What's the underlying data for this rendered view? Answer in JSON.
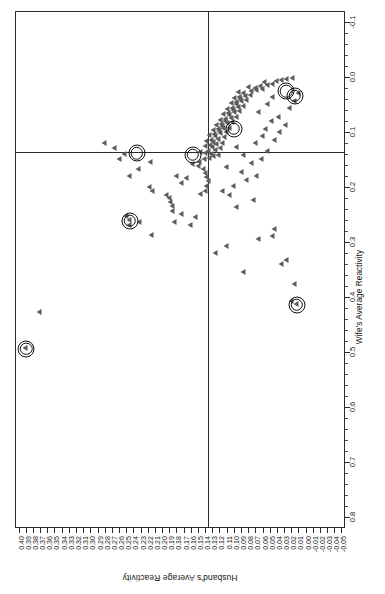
{
  "chart_data": {
    "type": "scatter",
    "title": "",
    "xlabel": "Wife's Average Reactivity",
    "ylabel": "Husband's Average Reactivity",
    "orientation": "rotated-90-landscape",
    "grid": false,
    "legend": null,
    "xlim": [
      -0.12,
      0.82
    ],
    "ylim": [
      -0.055,
      0.405
    ],
    "x_ticks": [
      -0.1,
      0.0,
      0.1,
      0.2,
      0.3,
      0.4,
      0.5,
      0.6,
      0.7,
      0.8
    ],
    "x_tick_labels": [
      "-0.1",
      "0.0",
      "0.1",
      "0.2",
      "0.3",
      "0.4",
      "0.5",
      "0.6",
      "0.7",
      "0.8"
    ],
    "y_ticks": [
      0.4,
      0.39,
      0.38,
      0.37,
      0.36,
      0.35,
      0.34,
      0.33,
      0.32,
      0.31,
      0.3,
      0.29,
      0.28,
      0.27,
      0.26,
      0.25,
      0.24,
      0.23,
      0.22,
      0.21,
      0.2,
      0.19,
      0.18,
      0.17,
      0.16,
      0.15,
      0.14,
      0.13,
      0.12,
      0.11,
      0.1,
      0.09,
      0.08,
      0.07,
      0.06,
      0.05,
      0.04,
      0.03,
      0.02,
      0.01,
      0.0,
      -0.01,
      -0.02,
      -0.03,
      -0.04,
      -0.05
    ],
    "y_tick_labels": [
      "0.40",
      "0.39",
      "0.38",
      "0.37",
      "0.36",
      "0.35",
      "0.34",
      "0.33",
      "0.32",
      "0.31",
      "0.30",
      "0.29",
      "0.28",
      "0.27",
      "0.26",
      "0.25",
      "0.24",
      "0.23",
      "0.22",
      "0.21",
      "0.20",
      "0.19",
      "0.18",
      "0.17",
      "0.16",
      "0.15",
      "0.14",
      "0.13",
      "0.12",
      "0.11",
      "0.10",
      "0.09",
      "0.08",
      "0.07",
      "0.06",
      "0.05",
      "0.04",
      "0.03",
      "0.02",
      "0.01",
      "0.00",
      "-0.01",
      "-0.02",
      "-0.03",
      "-0.04",
      "-0.05"
    ],
    "reference_lines": {
      "vline_x": 0.135,
      "hline_y": 0.138
    },
    "marker": "triangle-left",
    "marker_color": "#5d5d5d",
    "highlight_color": "#111111",
    "points": [
      [
        0.425,
        0.373
      ],
      [
        0.49,
        0.392
      ],
      [
        0.41,
        0.015
      ],
      [
        0.405,
        0.022
      ],
      [
        0.375,
        0.018
      ],
      [
        0.338,
        0.035
      ],
      [
        0.33,
        0.028
      ],
      [
        0.352,
        0.088
      ],
      [
        0.288,
        0.048
      ],
      [
        0.275,
        0.045
      ],
      [
        0.262,
        0.233
      ],
      [
        0.258,
        0.248
      ],
      [
        0.25,
        0.252
      ],
      [
        0.268,
        0.247
      ],
      [
        0.285,
        0.217
      ],
      [
        0.262,
        0.185
      ],
      [
        0.248,
        0.175
      ],
      [
        0.242,
        0.188
      ],
      [
        0.232,
        0.188
      ],
      [
        0.225,
        0.19
      ],
      [
        0.218,
        0.192
      ],
      [
        0.212,
        0.196
      ],
      [
        0.205,
        0.215
      ],
      [
        0.198,
        0.22
      ],
      [
        0.19,
        0.175
      ],
      [
        0.182,
        0.168
      ],
      [
        0.178,
        0.182
      ],
      [
        0.21,
        0.148
      ],
      [
        0.205,
        0.142
      ],
      [
        0.196,
        0.14
      ],
      [
        0.188,
        0.138
      ],
      [
        0.18,
        0.14
      ],
      [
        0.172,
        0.142
      ],
      [
        0.165,
        0.145
      ],
      [
        0.16,
        0.152
      ],
      [
        0.156,
        0.16
      ],
      [
        0.152,
        0.15
      ],
      [
        0.148,
        0.143
      ],
      [
        0.145,
        0.136
      ],
      [
        0.142,
        0.13
      ],
      [
        0.14,
        0.124
      ],
      [
        0.138,
        0.133
      ],
      [
        0.136,
        0.141
      ],
      [
        0.134,
        0.148
      ],
      [
        0.132,
        0.138
      ],
      [
        0.13,
        0.128
      ],
      [
        0.128,
        0.12
      ],
      [
        0.126,
        0.132
      ],
      [
        0.124,
        0.142
      ],
      [
        0.122,
        0.135
      ],
      [
        0.12,
        0.126
      ],
      [
        0.118,
        0.118
      ],
      [
        0.116,
        0.13
      ],
      [
        0.114,
        0.14
      ],
      [
        0.112,
        0.133
      ],
      [
        0.11,
        0.124
      ],
      [
        0.108,
        0.115
      ],
      [
        0.106,
        0.127
      ],
      [
        0.104,
        0.136
      ],
      [
        0.102,
        0.129
      ],
      [
        0.1,
        0.12
      ],
      [
        0.098,
        0.112
      ],
      [
        0.097,
        0.122
      ],
      [
        0.095,
        0.131
      ],
      [
        0.093,
        0.124
      ],
      [
        0.091,
        0.116
      ],
      [
        0.09,
        0.108
      ],
      [
        0.088,
        0.118
      ],
      [
        0.086,
        0.126
      ],
      [
        0.084,
        0.119
      ],
      [
        0.082,
        0.111
      ],
      [
        0.08,
        0.104
      ],
      [
        0.078,
        0.113
      ],
      [
        0.076,
        0.121
      ],
      [
        0.074,
        0.114
      ],
      [
        0.072,
        0.106
      ],
      [
        0.07,
        0.099
      ],
      [
        0.068,
        0.108
      ],
      [
        0.066,
        0.116
      ],
      [
        0.064,
        0.109
      ],
      [
        0.062,
        0.101
      ],
      [
        0.06,
        0.094
      ],
      [
        0.058,
        0.103
      ],
      [
        0.056,
        0.111
      ],
      [
        0.054,
        0.104
      ],
      [
        0.052,
        0.096
      ],
      [
        0.05,
        0.089
      ],
      [
        0.048,
        0.098
      ],
      [
        0.046,
        0.106
      ],
      [
        0.044,
        0.099
      ],
      [
        0.042,
        0.091
      ],
      [
        0.04,
        0.084
      ],
      [
        0.038,
        0.093
      ],
      [
        0.036,
        0.101
      ],
      [
        0.034,
        0.094
      ],
      [
        0.032,
        0.086
      ],
      [
        0.03,
        0.079
      ],
      [
        0.028,
        0.088
      ],
      [
        0.026,
        0.096
      ],
      [
        0.024,
        0.078
      ],
      [
        0.022,
        0.07
      ],
      [
        0.02,
        0.062
      ],
      [
        0.018,
        0.072
      ],
      [
        0.016,
        0.082
      ],
      [
        0.014,
        0.065
      ],
      [
        0.012,
        0.055
      ],
      [
        0.01,
        0.048
      ],
      [
        0.008,
        0.06
      ],
      [
        0.006,
        0.042
      ],
      [
        0.004,
        0.035
      ],
      [
        0.002,
        0.028
      ],
      [
        0.0,
        0.02
      ],
      [
        0.235,
        0.098
      ],
      [
        0.222,
        0.075
      ],
      [
        0.213,
        0.108
      ],
      [
        0.205,
        0.118
      ],
      [
        0.196,
        0.102
      ],
      [
        0.186,
        0.085
      ],
      [
        0.178,
        0.07
      ],
      [
        0.17,
        0.092
      ],
      [
        0.162,
        0.112
      ],
      [
        0.155,
        0.078
      ],
      [
        0.148,
        0.063
      ],
      [
        0.14,
        0.088
      ],
      [
        0.132,
        0.055
      ],
      [
        0.125,
        0.098
      ],
      [
        0.118,
        0.072
      ],
      [
        0.112,
        0.045
      ],
      [
        0.105,
        0.062
      ],
      [
        0.098,
        0.038
      ],
      [
        0.092,
        0.058
      ],
      [
        0.085,
        0.03
      ],
      [
        0.078,
        0.05
      ],
      [
        0.07,
        0.04
      ],
      [
        0.062,
        0.068
      ],
      [
        0.055,
        0.025
      ],
      [
        0.048,
        0.055
      ],
      [
        0.042,
        0.018
      ],
      [
        0.035,
        0.048
      ],
      [
        0.028,
        0.012
      ],
      [
        0.305,
        0.112
      ],
      [
        0.292,
        0.068
      ],
      [
        0.318,
        0.128
      ],
      [
        0.152,
        0.218
      ],
      [
        0.165,
        0.235
      ],
      [
        0.178,
        0.248
      ],
      [
        0.148,
        0.262
      ],
      [
        0.138,
        0.255
      ],
      [
        0.128,
        0.268
      ],
      [
        0.118,
        0.282
      ],
      [
        0.252,
        0.155
      ],
      [
        0.268,
        0.162
      ]
    ],
    "highlighted_points": [
      [
        0.49,
        0.392
      ],
      [
        0.41,
        0.015
      ],
      [
        0.258,
        0.248
      ],
      [
        0.135,
        0.238
      ],
      [
        0.138,
        0.16
      ],
      [
        0.09,
        0.103
      ],
      [
        0.022,
        0.03
      ],
      [
        0.03,
        0.018
      ]
    ],
    "n_points": 152,
    "n_highlighted": 8
  },
  "axes": {
    "x": {
      "title": "Wife's Average Reactivity",
      "labels": [
        "-0.1",
        "0.0",
        "0.1",
        "0.2",
        "0.3",
        "0.4",
        "0.5",
        "0.6",
        "0.7",
        "0.8"
      ]
    },
    "y": {
      "title": "Husband's Average Reactivity",
      "labels": [
        "0.40",
        "0.39",
        "0.38",
        "0.37",
        "0.36",
        "0.35",
        "0.34",
        "0.33",
        "0.32",
        "0.31",
        "0.30",
        "0.29",
        "0.28",
        "0.27",
        "0.26",
        "0.25",
        "0.24",
        "0.23",
        "0.22",
        "0.21",
        "0.20",
        "0.19",
        "0.18",
        "0.17",
        "0.16",
        "0.15",
        "0.14",
        "0.13",
        "0.12",
        "0.11",
        "0.10",
        "0.09",
        "0.08",
        "0.07",
        "0.06",
        "0.05",
        "0.04",
        "0.03",
        "0.02",
        "0.01",
        "0.00",
        "-0.01",
        "-0.02",
        "-0.03",
        "-0.04",
        "-0.05"
      ]
    }
  }
}
